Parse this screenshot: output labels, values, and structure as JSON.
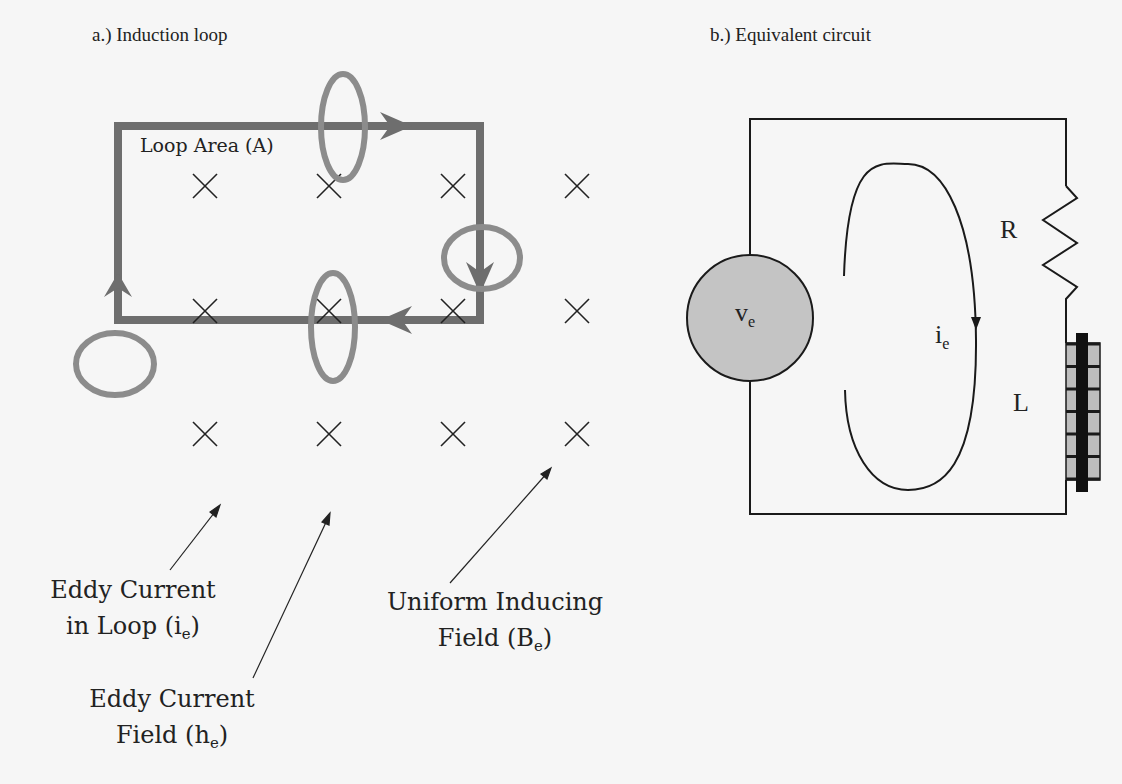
{
  "panels": {
    "a": {
      "title": "a.) Induction loop",
      "loop_area_label": "Loop Area (A)",
      "annotations": {
        "eddy_loop": {
          "line1": "Eddy Current",
          "line2": "in Loop (i",
          "sub": "e",
          "close": ")"
        },
        "uniform_field": {
          "line1": "Uniform Inducing",
          "line2": "Field (B",
          "sub": "e",
          "close": ")"
        },
        "eddy_field": {
          "line1": "Eddy Current",
          "line2": "Field (h",
          "sub": "e",
          "close": ")"
        }
      },
      "field_marker": "×",
      "field_grid": {
        "rows": 3,
        "cols": 4
      }
    },
    "b": {
      "title": "b.) Equivalent circuit",
      "source_label": "v",
      "source_sub": "e",
      "current_label": "i",
      "current_sub": "e",
      "resistor_label": "R",
      "inductor_label": "L"
    }
  },
  "colors": {
    "loop": "#6e6e6e",
    "eddy_ring": "#8c8c8c",
    "source_fill": "#c4c4c4",
    "inductor_fill": "#bdbdbd",
    "wire": "#1a1a1a"
  }
}
